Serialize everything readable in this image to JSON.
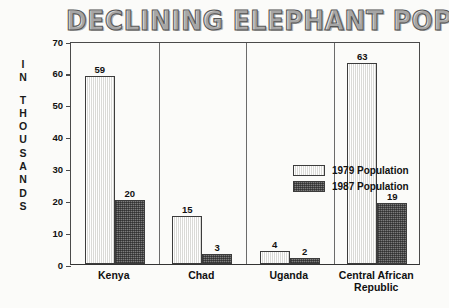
{
  "chart_data": {
    "type": "bar",
    "title": "DECLINING ELEPHANT POPULATION",
    "xlabel": "",
    "ylabel": "IN THOUSANDS",
    "ylim": [
      0,
      70
    ],
    "yticks": [
      0,
      10,
      20,
      30,
      40,
      50,
      60,
      70
    ],
    "grid": false,
    "legend_position": "center",
    "categories": [
      "Kenya",
      "Chad",
      "Uganda",
      "Central African Republic"
    ],
    "series": [
      {
        "name": "1979 Population",
        "values": [
          59,
          15,
          4,
          63
        ]
      },
      {
        "name": "1987 Population",
        "values": [
          20,
          3,
          2,
          19
        ]
      }
    ]
  },
  "axis": {
    "y_label_letters": [
      "I",
      "N",
      "",
      "T",
      "H",
      "O",
      "U",
      "S",
      "A",
      "N",
      "D",
      "S"
    ],
    "tick_labels": [
      "70",
      "60",
      "50",
      "40",
      "30",
      "20",
      "10",
      "0"
    ]
  },
  "legend": {
    "items": [
      {
        "label": "1979 Population",
        "key": "y1979"
      },
      {
        "label": "1987 Population",
        "key": "y1987"
      }
    ]
  },
  "categories_display": [
    {
      "label": "Kenya"
    },
    {
      "label": "Chad"
    },
    {
      "label": "Uganda"
    },
    {
      "label": "Central African\nRepublic"
    }
  ],
  "bar_values": {
    "kenya_1979": "59",
    "kenya_1987": "20",
    "chad_1979": "15",
    "chad_1987": "3",
    "uganda_1979": "4",
    "uganda_1987": "2",
    "car_1979": "63",
    "car_1987": "19"
  },
  "colors": {
    "background": "#fbfbf9",
    "ink": "#111111",
    "axis": "#4a4a4a",
    "bar_1979": "#e9e9e6",
    "bar_1987": "#7c7c7c"
  }
}
